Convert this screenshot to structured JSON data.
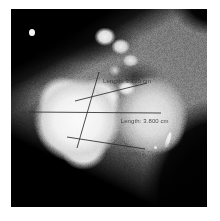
{
  "viewer": {
    "modality_label": "Cardiac CT angiography axial slice",
    "frame_color": "#ffffff",
    "background_color": "#050505"
  },
  "measurements": {
    "unit": "cm",
    "line_color": "#2a2a2a",
    "label_color": "#1c1c1c",
    "items": [
      {
        "id": "caliper-1",
        "label": "Length: 3.795 cm",
        "value": "3.795",
        "unit": "cm"
      },
      {
        "id": "caliper-2",
        "label": "Length: 3.800 cm",
        "value": "3.800",
        "unit": "cm"
      },
      {
        "id": "caliper-3",
        "label": "Length: 3.76 cm",
        "value": "3.76",
        "unit": "cm"
      }
    ]
  },
  "anatomy": {
    "valve_structure": "trileaflet aortic valve",
    "bright_regions": "contrast-enhanced vessels and aortic root",
    "dark_regions": "air and lung fields"
  }
}
